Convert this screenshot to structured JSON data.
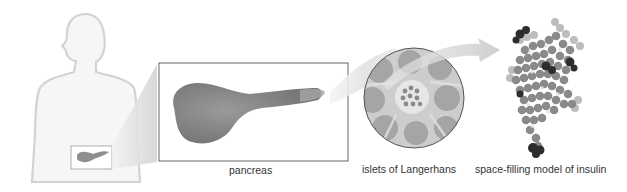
{
  "diagram": {
    "labels": {
      "pancreas": "pancreas",
      "islets": "islets of Langerhans",
      "insulin": "space-filling model of insulin"
    },
    "colors": {
      "body_outline": "#d6d6d6",
      "body_fill": "#f4f4f4",
      "organ": "#8c8c8c",
      "box_border": "#555555",
      "circle_bg": "#c8c8c8",
      "arrow": "#dcdcdc",
      "molecule_dark": "#2a2a2a",
      "molecule_mid": "#7a7a7a",
      "molecule_light": "#c4c4c4"
    },
    "stages": [
      "human body",
      "pancreas",
      "islets of Langerhans",
      "insulin molecule"
    ]
  }
}
